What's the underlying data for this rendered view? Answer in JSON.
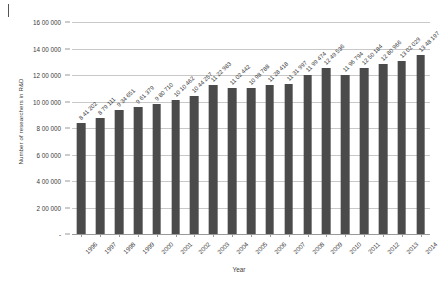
{
  "chart_data": {
    "type": "bar",
    "title": "",
    "xlabel": "Year",
    "ylabel": "Number of researchers in R&D",
    "categories": [
      "1996",
      "1997",
      "1998",
      "1999",
      "2000",
      "2001",
      "2002",
      "2003",
      "2004",
      "2005",
      "2006",
      "2007",
      "2008",
      "2009",
      "2010",
      "2011",
      "2012",
      "2013",
      "2014"
    ],
    "values": [
      841202,
      879111,
      934651,
      961379,
      980710,
      1010462,
      1044257,
      1122983,
      1102442,
      1098788,
      1128418,
      1131997,
      1199474,
      1249536,
      1196794,
      1250184,
      1280966,
      1302029,
      1348197
    ],
    "value_labels": [
      "8 41 202",
      "8 79 111",
      "9 34 651",
      "9 61 379",
      "9 80 710",
      "10 10 462",
      "10 44 257",
      "11 22 983",
      "11 02 442",
      "10 98 788",
      "11 28 418",
      "11 31 997",
      "11 99 474",
      "12 49 536",
      "11 96 794",
      "12 50 184",
      "12 80 966",
      "13 02 029",
      "13 48 197"
    ],
    "ylim": [
      0,
      1600000
    ],
    "ytick_values": [
      0,
      200000,
      400000,
      600000,
      800000,
      1000000,
      1200000,
      1400000,
      1600000
    ],
    "ytick_labels": [
      "-",
      "2 00 000",
      "4 00 000",
      "6 00 000",
      "8 00 000",
      "10 00 000",
      "12 00 000",
      "14 00 000",
      "16 00 000"
    ],
    "grid": "horizontal",
    "legend": "none",
    "bar_color": "#4b4b4b",
    "gridline_color": "#c8c8c8",
    "background_color": "#ffffff"
  }
}
